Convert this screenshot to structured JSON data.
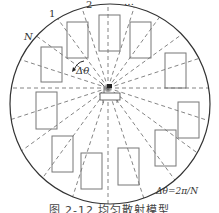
{
  "diagram": {
    "type": "uniform scattering model",
    "circle": {
      "cx": 110,
      "cy": 104,
      "r": 100,
      "stroke": "#333333"
    },
    "source": {
      "x": 108,
      "y": 88
    },
    "ray_count": 20,
    "ray_color": "#666666",
    "labels": {
      "sector_1": "1",
      "sector_2": "2",
      "sector_ellipsis": "…",
      "sector_N": "N",
      "angle_step": "Δθ",
      "formula": "Δθ=2π/N"
    },
    "scatterers": [
      {
        "x": 67,
        "y": 22,
        "w": 21,
        "h": 36
      },
      {
        "x": 99,
        "y": 15,
        "w": 21,
        "h": 36
      },
      {
        "x": 130,
        "y": 22,
        "w": 21,
        "h": 36
      },
      {
        "x": 41,
        "y": 47,
        "w": 21,
        "h": 35
      },
      {
        "x": 165,
        "y": 53,
        "w": 21,
        "h": 35
      },
      {
        "x": 36,
        "y": 92,
        "w": 21,
        "h": 37
      },
      {
        "x": 178,
        "y": 102,
        "w": 21,
        "h": 36
      },
      {
        "x": 52,
        "y": 136,
        "w": 21,
        "h": 36
      },
      {
        "x": 81,
        "y": 153,
        "w": 21,
        "h": 36
      },
      {
        "x": 118,
        "y": 148,
        "w": 21,
        "h": 37
      },
      {
        "x": 155,
        "y": 130,
        "w": 21,
        "h": 36
      }
    ],
    "rect_color": "#777777"
  },
  "caption": "图 2-12  均匀散射模型"
}
